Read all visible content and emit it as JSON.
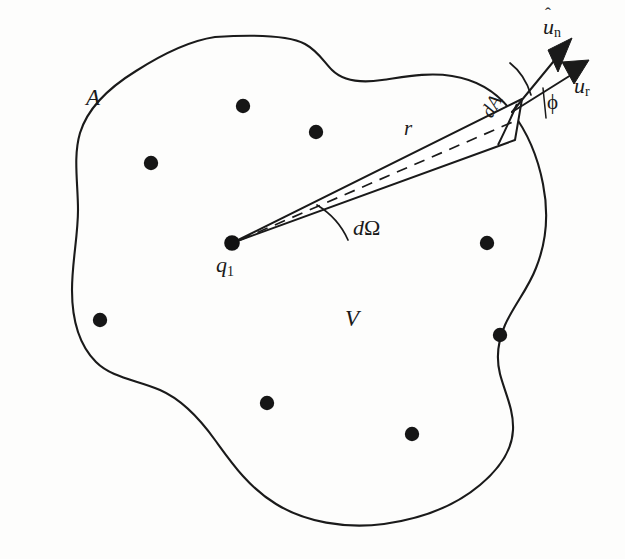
{
  "figure": {
    "kind": "physics-line-diagram",
    "title_text": "",
    "background_color": "#fdfdfc",
    "ink_color": "#1a1a1a"
  },
  "labels": {
    "surface_area": "A",
    "volume": "V",
    "distance": "r",
    "charge": "q",
    "charge_subscript": "1",
    "solid_angle_d": "d",
    "solid_angle_omega": "Ω",
    "angle_phi": "ϕ",
    "area_element": "dA",
    "unit_normal_u": "u",
    "unit_normal_sub": "n",
    "unit_radial_u": "u",
    "unit_radial_sub": "r",
    "hat": "ˆ"
  },
  "chart_data": {
    "type": "diagram",
    "source_charge": {
      "label": "q1",
      "x": 232,
      "y": 243
    },
    "interior_charges": [
      {
        "x": 243,
        "y": 106
      },
      {
        "x": 316,
        "y": 132
      },
      {
        "x": 151,
        "y": 163
      },
      {
        "x": 487,
        "y": 243
      },
      {
        "x": 100,
        "y": 320
      },
      {
        "x": 500,
        "y": 335
      },
      {
        "x": 267,
        "y": 403
      },
      {
        "x": 412,
        "y": 434
      }
    ],
    "cone": {
      "apex": [
        232,
        243
      ],
      "exit_center": [
        497,
        120
      ],
      "half_angle_deg": 2.2,
      "centerline_style": "dashed",
      "centerline_label": "r"
    },
    "vectors": [
      {
        "name": "u_n",
        "from": [
          512,
          112
        ],
        "to": [
          573,
          41
        ],
        "arrowhead": "solid-triangle"
      },
      {
        "name": "u_r",
        "from": [
          512,
          112
        ],
        "to": [
          588,
          64
        ],
        "arrowhead": "solid-triangle"
      }
    ],
    "angle_marks": [
      {
        "name": "d-Omega",
        "at": [
          232,
          243
        ],
        "label": "dΩ"
      },
      {
        "name": "phi",
        "between": [
          "u_n",
          "u_r"
        ],
        "label": "ϕ"
      }
    ],
    "axis_ranges": {
      "x": [
        0,
        625
      ],
      "y": [
        0,
        559
      ]
    },
    "grid": false,
    "legend": "none"
  }
}
